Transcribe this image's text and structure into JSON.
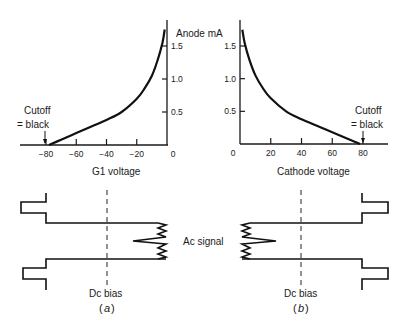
{
  "chart_data": [
    {
      "type": "line",
      "panel": "a",
      "title": "",
      "xlabel": "G1 voltage",
      "ylabel": "Anode mA",
      "x_ticks": [
        "-80",
        "-60",
        "-40",
        "-20",
        "0"
      ],
      "y_ticks": [
        "0.5",
        "1.0",
        "1.5"
      ],
      "xlim": [
        -95,
        0
      ],
      "ylim": [
        0,
        1.8
      ],
      "series": [
        {
          "name": "anode current",
          "x": [
            -78,
            -70,
            -60,
            -50,
            -40,
            -30,
            -20,
            -15,
            -10,
            -6,
            -3,
            -1.5
          ],
          "y": [
            0,
            0.08,
            0.18,
            0.28,
            0.38,
            0.5,
            0.7,
            0.85,
            1.05,
            1.3,
            1.55,
            1.75
          ]
        }
      ],
      "annotations": [
        {
          "text_line1": "Cutoff",
          "text_line2": "= black",
          "x": -78
        }
      ]
    },
    {
      "type": "line",
      "panel": "b",
      "title": "",
      "xlabel": "Cathode voltage",
      "ylabel": "",
      "x_ticks": [
        "0",
        "20",
        "40",
        "60",
        "80"
      ],
      "y_ticks": [
        "0.5",
        "1.0",
        "1.5"
      ],
      "xlim": [
        0,
        95
      ],
      "ylim": [
        0,
        1.8
      ],
      "series": [
        {
          "name": "anode current",
          "x": [
            1.5,
            3,
            6,
            10,
            15,
            20,
            30,
            40,
            50,
            60,
            70,
            78
          ],
          "y": [
            1.75,
            1.55,
            1.3,
            1.05,
            0.85,
            0.7,
            0.5,
            0.38,
            0.28,
            0.18,
            0.08,
            0
          ]
        }
      ],
      "annotations": [
        {
          "text_line1": "Cutoff",
          "text_line2": "= black",
          "x": 78
        }
      ]
    }
  ],
  "labels": {
    "y_axis_title": "Anode mA",
    "left_xlabel": "G1 voltage",
    "right_xlabel": "Cathode voltage",
    "cutoff_line1": "Cutoff",
    "cutoff_line2": "= black",
    "ac_signal": "Ac signal",
    "dc_bias": "Dc bias",
    "caption_a": "a",
    "caption_b": "b"
  }
}
